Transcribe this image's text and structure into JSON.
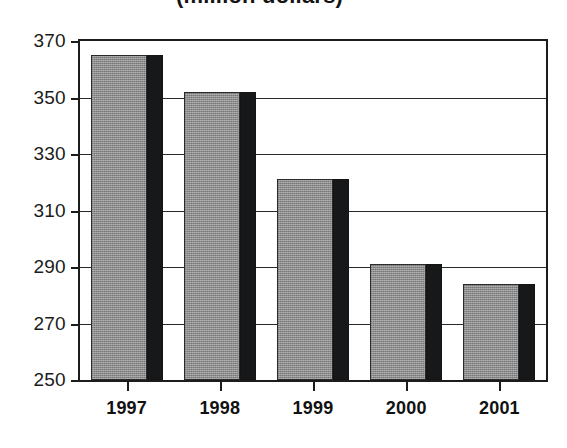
{
  "chart_title": "(million dollars)",
  "chart_data": {
    "type": "bar",
    "title": "(million dollars)",
    "subtitle": "",
    "xlabel": "",
    "ylabel": "",
    "categories": [
      "1997",
      "1998",
      "1999",
      "2000",
      "2001"
    ],
    "values": [
      365,
      352,
      321,
      291,
      284
    ],
    "ylim": [
      250,
      370
    ],
    "yticks": [
      250,
      270,
      290,
      310,
      330,
      350,
      370
    ],
    "ytick_labels": [
      "250",
      "270",
      "290",
      "310",
      "330",
      "350",
      "370"
    ],
    "grid": true,
    "legend": false,
    "legend_position": "none",
    "series": [
      {
        "name": "value",
        "values": [
          365,
          352,
          321,
          291,
          284
        ]
      }
    ],
    "colors": {
      "bar_face": "#8d8d8d",
      "bar_shadow": "#17181a",
      "axis": "#1c1c1c",
      "grid": "#2a2a2a",
      "text": "#111111",
      "background": "#ffffff"
    }
  }
}
